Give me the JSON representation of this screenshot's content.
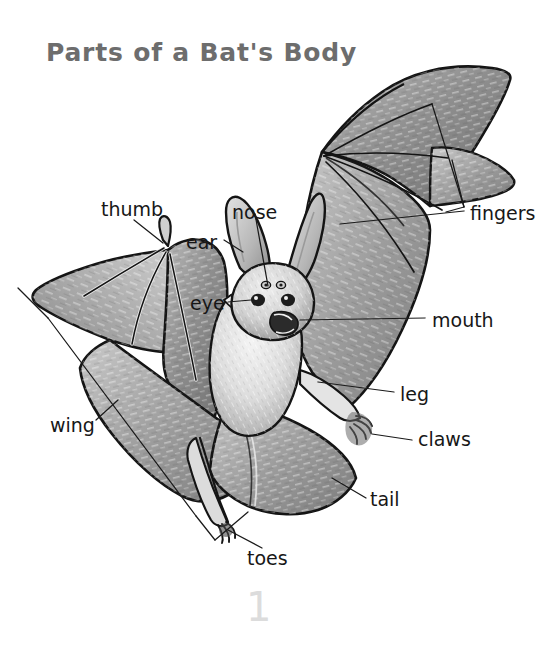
{
  "page": {
    "title": "Parts of a Bat's Body",
    "background_color": "#ffffff",
    "title_color": "#6d6d6d",
    "label_color": "#171717",
    "leader_line_color": "#1a1a1a",
    "artwork": {
      "name": "flying-bat-illustration",
      "style": "grayscale-pencil-drawing",
      "palette": {
        "wing_membrane_dark": "#7d7d7d",
        "wing_membrane_mid": "#9a9a9a",
        "wing_membrane_light": "#c2c2c2",
        "fur_light": "#ececec",
        "fur_mid": "#b8b8b8",
        "outline": "#141414"
      }
    }
  },
  "labels": [
    {
      "id": "thumb",
      "text": "thumb",
      "x": 101,
      "y": 200
    },
    {
      "id": "nose",
      "text": "nose",
      "x": 232,
      "y": 203
    },
    {
      "id": "ear",
      "text": "ear",
      "x": 186,
      "y": 233
    },
    {
      "id": "eye",
      "text": "eye",
      "x": 190,
      "y": 294
    },
    {
      "id": "fingers",
      "text": "fingers",
      "x": 470,
      "y": 204
    },
    {
      "id": "mouth",
      "text": "mouth",
      "x": 432,
      "y": 311
    },
    {
      "id": "leg",
      "text": "leg",
      "x": 400,
      "y": 395
    },
    {
      "id": "claws",
      "text": "claws",
      "x": 418,
      "y": 434
    },
    {
      "id": "tail",
      "text": "tail",
      "x": 370,
      "y": 500
    },
    {
      "id": "wing",
      "text": "wing",
      "x": 50,
      "y": 425
    },
    {
      "id": "toes",
      "text": "toes",
      "x": 247,
      "y": 557
    }
  ],
  "artifacts": {
    "pencil_mark": "1"
  }
}
